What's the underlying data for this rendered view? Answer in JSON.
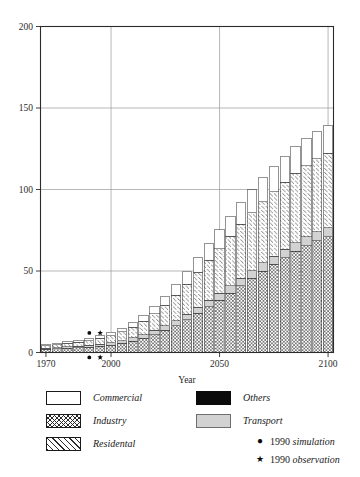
{
  "chart_data": {
    "type": "bar",
    "stacked": true,
    "title": "",
    "xlabel": "Year",
    "ylabel": "",
    "xlim": [
      1967.5,
      2102.5
    ],
    "ylim": [
      0,
      200
    ],
    "xticks": [
      1970,
      2000,
      2050,
      2100
    ],
    "yticks": [
      0,
      50,
      100,
      150,
      200
    ],
    "xtick_labels": [
      "1970",
      "2000",
      "2050",
      "2100"
    ],
    "ytick_labels": [
      "0",
      "50",
      "100",
      "150",
      "200"
    ],
    "grid": "horizontal-and-vertical-at-ticks",
    "legend_position": "below-axes",
    "categories": [
      1970,
      1975,
      1980,
      1985,
      1990,
      1995,
      2000,
      2005,
      2010,
      2015,
      2020,
      2025,
      2030,
      2035,
      2040,
      2045,
      2050,
      2055,
      2060,
      2065,
      2070,
      2075,
      2080,
      2085,
      2090,
      2095,
      2100
    ],
    "series": [
      {
        "name": "Industry",
        "pattern": "cross-hatch",
        "values": [
          2.0,
          2.3,
          2.6,
          2.9,
          3.3,
          3.8,
          4.6,
          5.6,
          7.0,
          8.8,
          11.0,
          13.5,
          16.5,
          20.0,
          24.0,
          28.0,
          32.0,
          36.5,
          41.0,
          45.5,
          50.0,
          54.0,
          58.0,
          62.0,
          65.5,
          68.5,
          71.0
        ]
      },
      {
        "name": "Transport",
        "pattern": "solid-gray",
        "values": [
          0.6,
          0.7,
          0.8,
          0.9,
          1.0,
          1.2,
          1.4,
          1.6,
          1.9,
          2.2,
          2.5,
          2.8,
          3.1,
          3.4,
          3.7,
          4.0,
          4.2,
          4.4,
          4.6,
          4.8,
          5.0,
          5.1,
          5.2,
          5.3,
          5.4,
          5.5,
          5.6
        ]
      },
      {
        "name": "Residental",
        "pattern": "diagonal-hatch",
        "values": [
          1.6,
          1.9,
          2.2,
          2.6,
          3.0,
          3.6,
          4.4,
          5.4,
          6.6,
          8.2,
          10.2,
          12.6,
          15.4,
          18.4,
          21.5,
          24.6,
          27.6,
          30.4,
          33.0,
          35.4,
          37.6,
          39.5,
          41.2,
          42.6,
          43.8,
          44.8,
          45.6
        ]
      },
      {
        "name": "Commercial",
        "pattern": "white",
        "values": [
          0.8,
          0.9,
          1.0,
          1.2,
          1.4,
          1.6,
          2.0,
          2.4,
          3.0,
          3.7,
          4.6,
          5.6,
          6.7,
          7.9,
          9.1,
          10.3,
          11.4,
          12.4,
          13.3,
          14.1,
          14.8,
          15.4,
          15.8,
          16.2,
          16.5,
          16.7,
          16.8
        ]
      },
      {
        "name": "Others",
        "pattern": "black",
        "values": [
          0.0,
          0.0,
          0.0,
          0.0,
          0.0,
          0.0,
          0.0,
          0.0,
          0.0,
          0.0,
          0.0,
          0.0,
          0.0,
          0.0,
          0.0,
          0.0,
          0.0,
          0.0,
          0.0,
          0.0,
          0.0,
          0.0,
          0.0,
          0.0,
          0.0,
          0.0,
          0.0
        ]
      }
    ],
    "totals": [
      5.0,
      5.8,
      6.6,
      7.6,
      8.7,
      10.2,
      12.4,
      15.0,
      18.5,
      22.9,
      28.3,
      34.5,
      41.7,
      49.7,
      58.3,
      66.9,
      75.2,
      83.7,
      91.9,
      99.8,
      107.4,
      114.0,
      120.2,
      126.1,
      131.2,
      135.5,
      139.0
    ],
    "annotations": [
      {
        "label": "1990 simulation",
        "marker": "dot",
        "x": 1990,
        "y": 12.0
      },
      {
        "label": "1990 simulation",
        "marker": "dot",
        "x": 1990,
        "y": -3.0
      },
      {
        "label": "1990 observation",
        "marker": "star",
        "x": 1995,
        "y": 12.0
      },
      {
        "label": "1990 observation",
        "marker": "star",
        "x": 1995,
        "y": -3.0
      }
    ]
  },
  "axes": {
    "xlabel": "Year",
    "xtick_labels": [
      "1970",
      "2000",
      "2050",
      "2100"
    ],
    "ytick_labels": [
      "0",
      "50",
      "100",
      "150",
      "200"
    ]
  },
  "legend": {
    "left_entries": [
      {
        "label": "Commercial",
        "swatch": "commercial"
      },
      {
        "label": "Industry",
        "swatch": "industry"
      },
      {
        "label": "Residental",
        "swatch": "residental"
      }
    ],
    "right_entries": [
      {
        "label": "Others",
        "swatch": "others"
      },
      {
        "label": "Transport",
        "swatch": "transport"
      }
    ],
    "marker_entries": [
      {
        "glyph": "●",
        "year": "1990",
        "kind": "simulation"
      },
      {
        "glyph": "★",
        "year": "1990",
        "kind": "observation"
      }
    ]
  },
  "colors": {
    "axis": "#2b2b2b",
    "grid": "#9a9a9a",
    "bar_outline": "#2a2a2a",
    "transport_fill": "#d2d2d2",
    "others_fill": "#0b0b0b",
    "commercial_fill": "#ffffff",
    "text": "#1a1a1a"
  }
}
